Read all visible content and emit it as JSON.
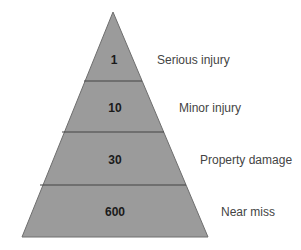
{
  "diagram": {
    "type": "pyramid",
    "colors": {
      "fill": "#9b9b9b",
      "edge": "#6e6e6e",
      "divider": "#444444",
      "value_text": "#1a1a1a",
      "label_text": "#444444"
    },
    "tiers": [
      {
        "value": "1",
        "label": "Serious injury"
      },
      {
        "value": "10",
        "label": "Minor injury"
      },
      {
        "value": "30",
        "label": "Property damage"
      },
      {
        "value": "600",
        "label": "Near miss"
      }
    ]
  }
}
